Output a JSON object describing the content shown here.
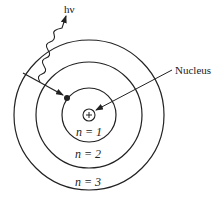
{
  "diagram": {
    "photon_label": "hν",
    "nucleus_label": "Nucleus",
    "nucleus_symbol": "+",
    "orbit_labels": [
      "n = 1",
      "n = 2",
      "n = 3"
    ],
    "colors": {
      "line": "#222222",
      "background": "#ffffff"
    }
  }
}
